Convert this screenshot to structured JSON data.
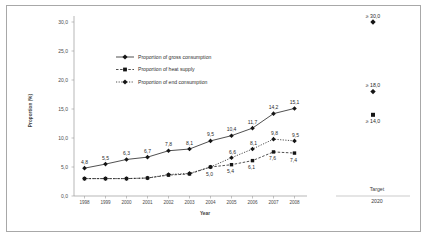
{
  "chart_data": {
    "type": "line",
    "title": "",
    "xlabel": "Year",
    "ylabel": "Proportion (%)",
    "categories": [
      "1998",
      "1999",
      "2000",
      "2001",
      "2002",
      "2003",
      "2004",
      "2005",
      "2006",
      "2007",
      "2008"
    ],
    "ylim": [
      0.0,
      30.0
    ],
    "yticks": [
      "0,0",
      "5,0",
      "10,0",
      "15,0",
      "20,0",
      "25,0",
      "30,0"
    ],
    "ytick_values": [
      0.0,
      5.0,
      10.0,
      15.0,
      20.0,
      25.0,
      30.0
    ],
    "grid": false,
    "legend_position": "upper-left-inside",
    "series": [
      {
        "name": "Proportion of gross consumption",
        "marker": "diamond",
        "line": "solid",
        "color": "#1a1a1a",
        "values": [
          4.8,
          5.5,
          6.3,
          6.7,
          7.8,
          8.1,
          9.5,
          10.4,
          11.7,
          14.2,
          15.1
        ],
        "labels": [
          "4,8",
          "5,5",
          "6,3",
          "6,7",
          "7,8",
          "8,1",
          "9,5",
          "10,4",
          "11,7",
          "14,2",
          "15,1"
        ]
      },
      {
        "name": "Proportion of heat supply",
        "marker": "square",
        "line": "dashed",
        "color": "#1a1a1a",
        "values": [
          3.0,
          3.0,
          3.0,
          3.1,
          3.6,
          3.8,
          5.0,
          5.4,
          6.1,
          7.6,
          7.4
        ],
        "labels": [
          "",
          "",
          "",
          "",
          "",
          "",
          "5,0",
          "5,4",
          "6,1",
          "7,6",
          "7,4"
        ]
      },
      {
        "name": "Proportion of end consumption",
        "marker": "diamond",
        "line": "dotted",
        "color": "#1a1a1a",
        "values": [
          3.0,
          3.0,
          3.0,
          3.1,
          3.7,
          3.9,
          5.0,
          6.6,
          8.1,
          9.8,
          9.5
        ],
        "labels": [
          "",
          "",
          "",
          "",
          "",
          "",
          "",
          "6,6",
          "8,1",
          "9,8",
          "9,5"
        ]
      }
    ],
    "target_panel": {
      "caption": "Target",
      "year": "2020",
      "points": [
        {
          "series": "Proportion of gross consumption",
          "marker": "diamond",
          "value": 30.0,
          "label": "≥ 30,0",
          "label_position": "above"
        },
        {
          "series": "Proportion of end consumption",
          "marker": "diamond",
          "value": 18.0,
          "label": "≥ 18,0",
          "label_position": "above"
        },
        {
          "series": "Proportion of heat supply",
          "marker": "square",
          "value": 14.0,
          "label": "≥ 14,0",
          "label_position": "below"
        }
      ]
    },
    "annotations": []
  },
  "figure": {
    "border_color": "#a8a8a8",
    "background": "#ffffff"
  }
}
